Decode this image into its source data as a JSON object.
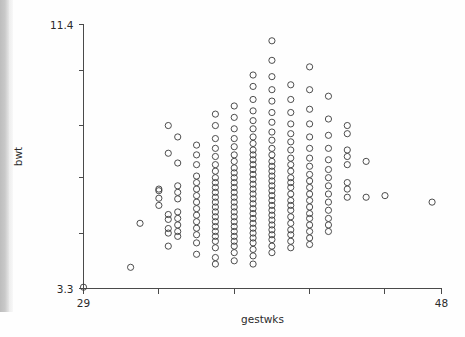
{
  "figure": {
    "background_color": "#fefefe",
    "ink_color": "#3a3a3a",
    "axis_color": "#4a4a4a",
    "page_edge_color": "#c9c9c9"
  },
  "chart_data": {
    "type": "scatter",
    "title": "",
    "subtitle": "",
    "xlabel": "gestwks",
    "ylabel": "bwt",
    "xlim": [
      29,
      48
    ],
    "ylim": [
      3.3,
      11.4
    ],
    "x_tick_labels": [
      "29",
      "48"
    ],
    "x_tick_values": [
      29,
      48
    ],
    "x_minor_tick_values": [
      33,
      37,
      41,
      45
    ],
    "y_tick_labels": [
      "3.3",
      "11.4"
    ],
    "y_tick_values": [
      3.3,
      11.4
    ],
    "y_minor_tick_values": [
      5.0,
      6.7,
      8.3,
      10.0
    ],
    "grid": false,
    "legend": null,
    "marker": "open-circle",
    "marker_size_px": 3.1,
    "point_count": 492,
    "note": "Birthweight (kg) against gestational age (weeks); x values are integer weeks so points form vertical columns.",
    "columns": [
      {
        "x": 29,
        "values": [
          3.34
        ]
      },
      {
        "x": 31.5,
        "values": [
          3.95
        ]
      },
      {
        "x": 32,
        "values": [
          5.3
        ]
      },
      {
        "x": 33,
        "values": [
          6.07,
          6.3,
          6.35,
          5.85
        ]
      },
      {
        "x": 33.5,
        "values": [
          5.0,
          5.14,
          5.42,
          5.57,
          7.45,
          8.3,
          4.6
        ]
      },
      {
        "x": 34,
        "values": [
          4.9,
          5.05,
          5.25,
          5.45,
          5.65,
          6.05,
          6.25,
          6.45,
          7.15,
          7.95
        ]
      },
      {
        "x": 35,
        "values": [
          4.7,
          4.95,
          5.15,
          5.35,
          5.55,
          5.75,
          5.95,
          6.15,
          6.35,
          6.55,
          6.75,
          7.1,
          7.4,
          7.7,
          4.35
        ]
      },
      {
        "x": 36,
        "values": [
          4.55,
          4.75,
          4.9,
          5.05,
          5.2,
          5.35,
          5.5,
          5.65,
          5.8,
          5.95,
          6.1,
          6.25,
          6.4,
          6.55,
          6.7,
          6.9,
          7.1,
          7.35,
          7.6,
          7.9,
          8.3,
          8.65,
          4.25,
          4.05
        ]
      },
      {
        "x": 37,
        "values": [
          4.4,
          4.6,
          4.75,
          4.9,
          5.05,
          5.2,
          5.35,
          5.5,
          5.65,
          5.8,
          5.95,
          6.1,
          6.25,
          6.4,
          6.55,
          6.7,
          6.85,
          7.0,
          7.2,
          7.4,
          7.65,
          7.9,
          8.2,
          8.55,
          8.9,
          4.15
        ]
      },
      {
        "x": 38,
        "values": [
          4.3,
          4.5,
          4.7,
          4.85,
          5.0,
          5.15,
          5.3,
          5.45,
          5.6,
          5.75,
          5.9,
          6.05,
          6.2,
          6.35,
          6.5,
          6.65,
          6.8,
          6.95,
          7.1,
          7.25,
          7.4,
          7.55,
          7.75,
          7.95,
          8.2,
          8.45,
          8.75,
          9.1,
          9.5,
          9.85,
          4.05
        ]
      },
      {
        "x": 39,
        "values": [
          4.6,
          4.8,
          4.95,
          5.1,
          5.25,
          5.4,
          5.55,
          5.7,
          5.85,
          6.0,
          6.15,
          6.3,
          6.45,
          6.6,
          6.75,
          6.9,
          7.05,
          7.2,
          7.4,
          7.6,
          7.85,
          8.1,
          8.4,
          8.7,
          9.05,
          9.4,
          9.8,
          10.3,
          10.9,
          4.4
        ]
      },
      {
        "x": 40,
        "values": [
          4.75,
          4.95,
          5.1,
          5.3,
          5.5,
          5.7,
          5.85,
          6.0,
          6.2,
          6.4,
          6.55,
          6.7,
          6.9,
          7.1,
          7.3,
          7.55,
          7.8,
          8.05,
          8.35,
          8.7,
          9.1,
          9.55,
          4.55
        ]
      },
      {
        "x": 41,
        "values": [
          4.85,
          5.05,
          5.25,
          5.45,
          5.6,
          5.8,
          6.0,
          6.2,
          6.4,
          6.6,
          6.8,
          7.05,
          7.3,
          7.6,
          7.95,
          8.35,
          8.8,
          9.4,
          10.1,
          4.65
        ]
      },
      {
        "x": 42,
        "values": [
          5.05,
          5.25,
          5.45,
          5.7,
          5.95,
          6.2,
          6.45,
          6.7,
          6.95,
          7.25,
          7.6,
          8.0,
          8.5,
          9.2
        ]
      },
      {
        "x": 43,
        "values": [
          6.1,
          6.35,
          6.55,
          7.1,
          7.35,
          7.55,
          8.05,
          8.3
        ]
      },
      {
        "x": 44,
        "values": [
          6.1,
          7.2
        ]
      },
      {
        "x": 45,
        "values": [
          6.15
        ]
      },
      {
        "x": 47.5,
        "values": [
          5.95
        ]
      }
    ]
  }
}
